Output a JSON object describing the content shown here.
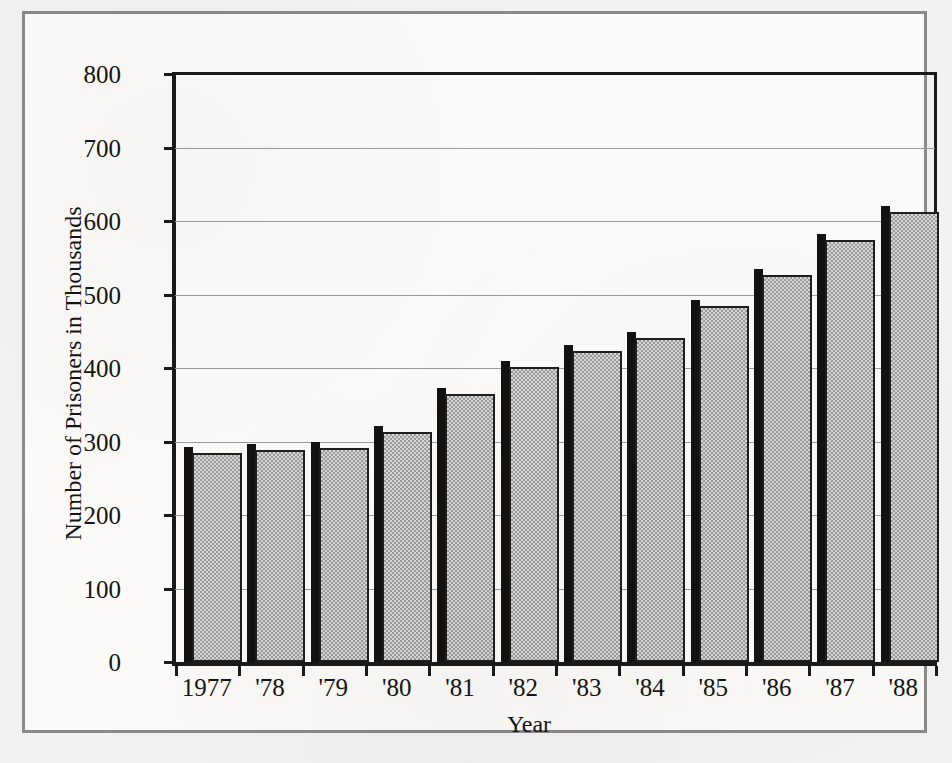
{
  "chart_data": {
    "type": "bar",
    "title": "",
    "xlabel": "Year",
    "ylabel": "Number of Prisoners in Thousands",
    "categories": [
      "1977",
      "'78",
      "'79",
      "'80",
      "'81",
      "'82",
      "'83",
      "'84",
      "'85",
      "'86",
      "'87",
      "'88"
    ],
    "values": [
      292,
      297,
      300,
      321,
      373,
      409,
      431,
      449,
      493,
      535,
      582,
      621
    ],
    "ylim": [
      0,
      800
    ],
    "ytick_values": [
      0,
      100,
      200,
      300,
      400,
      500,
      600,
      700,
      800
    ],
    "ytick_labels": [
      "0",
      "100",
      "200",
      "300",
      "400",
      "500",
      "600",
      "700",
      "800"
    ],
    "grid": true,
    "legend": null,
    "legend_position": "none",
    "bar_fill_color": "#bdbdbd",
    "bar_edge_color": "#1e1e1e",
    "bar_shadow_color": "#121212",
    "gridline_color": "#9c9c9c",
    "axis_color": "#1a1a1a",
    "frame_color": "#8a8a8a",
    "background_color": "#fbfaf8"
  }
}
